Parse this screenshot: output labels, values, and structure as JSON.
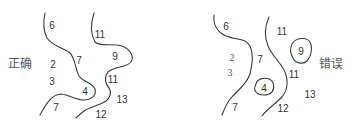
{
  "diagrams": {
    "correct": {
      "caption": "正确",
      "labels": {
        "l6": "6",
        "l2": "2",
        "l3": "3",
        "l7a": "7",
        "l4": "4",
        "l7b": "7",
        "l11a": "11",
        "l9": "9",
        "l11b": "11",
        "l13": "13",
        "l12": "12"
      }
    },
    "wrong": {
      "caption": "错误",
      "labels": {
        "l6": "6",
        "l2": "2",
        "l3": "3",
        "l7a": "7",
        "l4": "4",
        "l7b": "7",
        "l11a": "11",
        "l9": "9",
        "l11b": "11",
        "l13": "13",
        "l12": "12"
      }
    }
  },
  "colors": {
    "line": "#3a3a3a",
    "text": "#333333",
    "caption": "#555555",
    "background": "#ffffff"
  }
}
